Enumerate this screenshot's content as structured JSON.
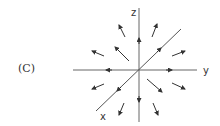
{
  "panel": {
    "label": "(C)"
  },
  "axes": {
    "z_label": "z",
    "y_label": "y",
    "x_label": "x"
  },
  "style": {
    "line_color": "#555555",
    "arrow_color": "#333333",
    "text_color": "#333333"
  },
  "field": {
    "description": "Radially outward vector field from the origin",
    "arrow_count": 12,
    "axis_arrows": [
      "up (+z)",
      "down (-z)",
      "right (+y)",
      "left (-y)",
      "toward +x (lower-left)",
      "toward -x (upper-right)"
    ]
  }
}
